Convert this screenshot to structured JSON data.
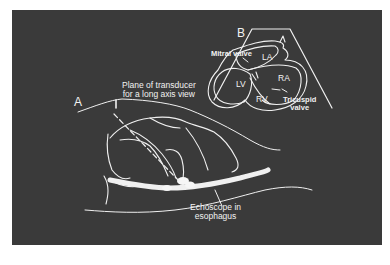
{
  "figure": {
    "panel_a": {
      "label": "A",
      "plane_label_line1": "Plane of transducer",
      "plane_label_line2": "for a long axis view",
      "echoscope_label_line1": "Echoscope in",
      "echoscope_label_line2": "esophagus"
    },
    "panel_b": {
      "label": "B",
      "mitral_valve": "Mitral valve",
      "tricuspid_valve_line1": "Tricuspid",
      "tricuspid_valve_line2": "valve",
      "chambers": {
        "la": "LA",
        "ra": "RA",
        "lv": "LV",
        "rv": "RV"
      }
    },
    "colors": {
      "background": "#ffffff",
      "panel": "#3a3a3a",
      "line": "#f2f2f2"
    }
  }
}
